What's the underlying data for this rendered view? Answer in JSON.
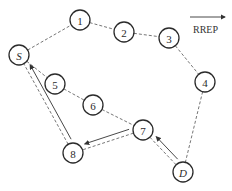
{
  "legend": {
    "label": "RREP",
    "arrow": "right-arrow"
  },
  "nodes": [
    {
      "id": "S",
      "label": "S",
      "italic": true,
      "x": 19,
      "y": 55
    },
    {
      "id": "1",
      "label": "1",
      "italic": false,
      "x": 80,
      "y": 20
    },
    {
      "id": "2",
      "label": "2",
      "italic": false,
      "x": 124,
      "y": 32
    },
    {
      "id": "3",
      "label": "3",
      "italic": false,
      "x": 169,
      "y": 38
    },
    {
      "id": "4",
      "label": "4",
      "italic": false,
      "x": 205,
      "y": 82
    },
    {
      "id": "5",
      "label": "5",
      "italic": false,
      "x": 55,
      "y": 84
    },
    {
      "id": "6",
      "label": "6",
      "italic": false,
      "x": 93,
      "y": 105
    },
    {
      "id": "7",
      "label": "7",
      "italic": false,
      "x": 143,
      "y": 130
    },
    {
      "id": "8",
      "label": "8",
      "italic": false,
      "x": 73,
      "y": 153
    },
    {
      "id": "D",
      "label": "D",
      "italic": true,
      "x": 183,
      "y": 172
    }
  ],
  "links": [
    [
      "S",
      "1"
    ],
    [
      "1",
      "2"
    ],
    [
      "2",
      "3"
    ],
    [
      "3",
      "4"
    ],
    [
      "4",
      "D"
    ],
    [
      "S",
      "5"
    ],
    [
      "5",
      "6"
    ],
    [
      "6",
      "7"
    ],
    [
      "7",
      "D"
    ],
    [
      "7",
      "8"
    ],
    [
      "8",
      "S"
    ]
  ],
  "rrep_path": [
    {
      "from": "D",
      "to": "7"
    },
    {
      "from": "7",
      "to": "8"
    },
    {
      "from": "8",
      "to": "S"
    }
  ]
}
